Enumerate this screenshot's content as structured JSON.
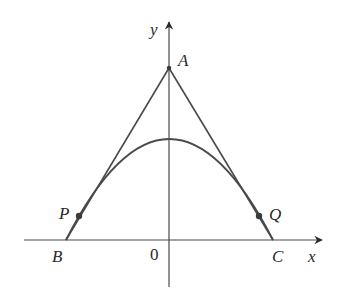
{
  "diagram": {
    "type": "parabola-with-tangent-lines",
    "axes": {
      "x_label": "x",
      "y_label": "y",
      "origin_label": "0"
    },
    "points": {
      "A": {
        "label": "A",
        "desc": "intersection of tangent lines on y-axis"
      },
      "B": {
        "label": "B",
        "desc": "left tangent meets x-axis"
      },
      "C": {
        "label": "C",
        "desc": "right tangent meets x-axis"
      },
      "P": {
        "label": "P",
        "desc": "point of tangency on left"
      },
      "Q": {
        "label": "Q",
        "desc": "point of tangency on right"
      }
    },
    "colors": {
      "stroke": "#4a4a4a",
      "text": "#2a2a2a",
      "background": "#ffffff"
    }
  }
}
